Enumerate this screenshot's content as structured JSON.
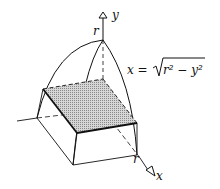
{
  "diagram": {
    "labels": {
      "y_axis": "y",
      "x_axis": "x",
      "r_top": "r",
      "r_x": "r",
      "equation_lhs": "x = ",
      "equation_radicand": "r² − y²"
    },
    "colors": {
      "ink": "#111111",
      "shade": "#b8b8b8",
      "background": "#ffffff"
    }
  }
}
